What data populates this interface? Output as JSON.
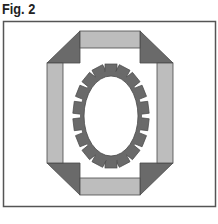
{
  "figure": {
    "label": "Fig. 2",
    "colors": {
      "frame": "#555555",
      "dark": "#6a6a6a",
      "light": "#bdbdbd",
      "outline": "#4a4a4a",
      "background": "#ffffff"
    },
    "frame_box": {
      "x": 3,
      "y": 21,
      "w": 213,
      "h": 186
    },
    "octagon_border": {
      "top_band": {
        "x": 80,
        "y": 31,
        "w": 60,
        "h": 17
      },
      "bottom_band": {
        "x": 80,
        "y": 178,
        "w": 60,
        "h": 17
      },
      "left_band": {
        "x": 47,
        "y": 63,
        "w": 16,
        "h": 100
      },
      "right_band": {
        "x": 157,
        "y": 63,
        "w": 16,
        "h": 100
      },
      "corner_triangles": [
        "top-left",
        "top-right",
        "bottom-left",
        "bottom-right"
      ]
    },
    "rosette": {
      "cx": 111,
      "cy": 116,
      "inner_rx": 27,
      "inner_ry": 40,
      "ring_rx": 31,
      "ring_ry": 45,
      "tooth_count": 18
    }
  }
}
